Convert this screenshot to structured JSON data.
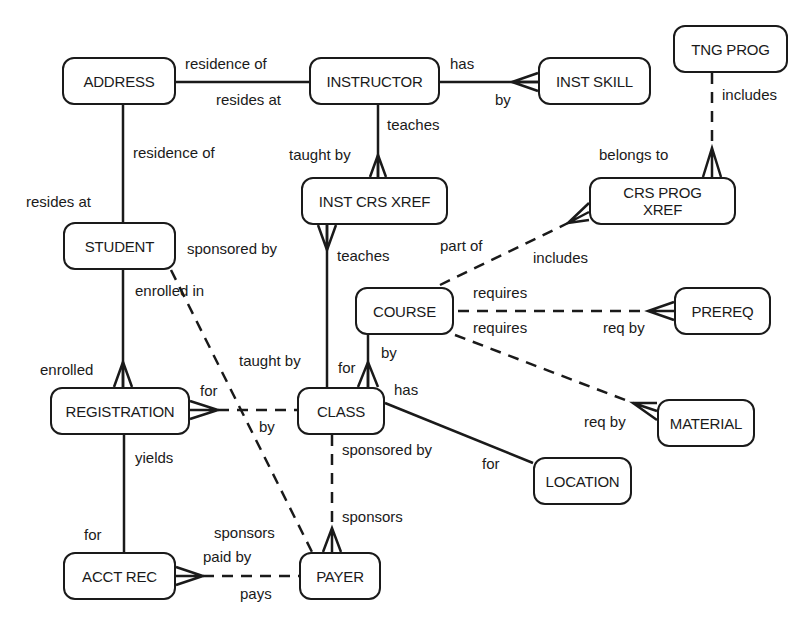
{
  "diagram": {
    "type": "entity-relationship",
    "notation": "crow's foot; solid line = identifying/mandatory, dashed line = optional",
    "entities": [
      {
        "id": "address",
        "label": "ADDRESS"
      },
      {
        "id": "instructor",
        "label": "INSTRUCTOR"
      },
      {
        "id": "inst_skill",
        "label": "INST SKILL"
      },
      {
        "id": "tng_prog",
        "label": "TNG PROG"
      },
      {
        "id": "inst_crs_xref",
        "label": "INST CRS XREF"
      },
      {
        "id": "crs_prog_xref",
        "label": "CRS PROG XREF"
      },
      {
        "id": "student",
        "label": "STUDENT"
      },
      {
        "id": "course",
        "label": "COURSE"
      },
      {
        "id": "prereq",
        "label": "PREREQ"
      },
      {
        "id": "registration",
        "label": "REGISTRATION"
      },
      {
        "id": "class",
        "label": "CLASS"
      },
      {
        "id": "material",
        "label": "MATERIAL"
      },
      {
        "id": "location",
        "label": "LOCATION"
      },
      {
        "id": "acct_rec",
        "label": "ACCT REC"
      },
      {
        "id": "payer",
        "label": "PAYER"
      }
    ],
    "relationships": [
      {
        "from": "ADDRESS",
        "to": "INSTRUCTOR",
        "style": "solid",
        "from_many": false,
        "to_many": false,
        "label_from": "residence of",
        "label_to": "resides at"
      },
      {
        "from": "INSTRUCTOR",
        "to": "INST SKILL",
        "style": "solid",
        "from_many": false,
        "to_many": true,
        "label_from": "has",
        "label_to": "by"
      },
      {
        "from": "INSTRUCTOR",
        "to": "INST CRS XREF",
        "style": "solid",
        "from_many": false,
        "to_many": true,
        "label_from": "teaches",
        "label_to": "taught by"
      },
      {
        "from": "TNG PROG",
        "to": "CRS PROG XREF",
        "style": "dashed",
        "from_many": false,
        "to_many": true,
        "label_from": "includes",
        "label_to": "belongs to"
      },
      {
        "from": "ADDRESS",
        "to": "STUDENT",
        "style": "solid",
        "from_many": false,
        "to_many": false,
        "label_from": "residence of",
        "label_to": "resides at"
      },
      {
        "from": "CLASS",
        "to": "INST CRS XREF",
        "style": "solid",
        "from_many": false,
        "to_many": true,
        "label_from": "taught by",
        "label_to": "teaches"
      },
      {
        "from": "COURSE",
        "to": "CRS PROG XREF",
        "style": "dashed",
        "from_many": false,
        "to_many": true,
        "label_from": "part of",
        "label_to": "includes"
      },
      {
        "from": "COURSE",
        "to": "PREREQ",
        "style": "dashed",
        "from_many": false,
        "to_many": true,
        "label_from": "requires",
        "label_to": "req by"
      },
      {
        "from": "COURSE",
        "to": "MATERIAL",
        "style": "dashed",
        "from_many": false,
        "to_many": true,
        "label_from": "requires",
        "label_to": "req by"
      },
      {
        "from": "COURSE",
        "to": "CLASS",
        "style": "solid",
        "from_many": false,
        "to_many": true,
        "label_from": "by",
        "label_to": "for"
      },
      {
        "from": "STUDENT",
        "to": "REGISTRATION",
        "style": "solid",
        "from_many": false,
        "to_many": true,
        "label_from": "enrolled in",
        "label_to": "enrolled"
      },
      {
        "from": "STUDENT",
        "to": "PAYER",
        "style": "dashed",
        "from_many": false,
        "to_many": false,
        "label_from": "sponsored by",
        "label_to": "sponsors"
      },
      {
        "from": "CLASS",
        "to": "REGISTRATION",
        "style": "dashed",
        "from_many": false,
        "to_many": true,
        "label_from": "by",
        "label_to": "for"
      },
      {
        "from": "CLASS",
        "to": "LOCATION",
        "style": "solid",
        "from_many": false,
        "to_many": false,
        "label_from": "has",
        "label_to": "for"
      },
      {
        "from": "PAYER",
        "to": "CLASS",
        "style": "dashed",
        "from_many": true,
        "to_many": false,
        "label_from": "sponsors",
        "label_to": "sponsored by"
      },
      {
        "from": "REGISTRATION",
        "to": "ACCT REC",
        "style": "solid",
        "from_many": false,
        "to_many": false,
        "label_from": "yields",
        "label_to": "for"
      },
      {
        "from": "PAYER",
        "to": "ACCT REC",
        "style": "dashed",
        "from_many": false,
        "to_many": true,
        "label_from": "pays",
        "label_to": "paid by"
      }
    ],
    "edge_labels": {
      "addr_instr_top": "residence of",
      "addr_instr_bottom": "resides at",
      "instr_skill_has": "has",
      "instr_skill_by": "by",
      "instr_teaches": "teaches",
      "xref_taught_by": "taught by",
      "tng_includes": "includes",
      "crs_prog_belongs": "belongs to",
      "addr_student_residence": "residence of",
      "addr_student_resides": "resides at",
      "student_sponsored_by": "sponsored by",
      "xref_class_teaches": "teaches",
      "course_part_of": "part of",
      "course_includes": "includes",
      "student_enrolled_in": "enrolled in",
      "course_prereq_requires": "requires",
      "course_material_requires": "requires",
      "prereq_req_by": "req by",
      "class_taught_by": "taught by",
      "course_class_by": "by",
      "class_course_for": "for",
      "reg_enrolled": "enrolled",
      "class_has": "has",
      "reg_for": "for",
      "class_reg_by": "by",
      "material_req_by": "req by",
      "class_sponsored_by": "sponsored by",
      "location_for": "for",
      "reg_yields": "yields",
      "payer_sponsors_class": "sponsors",
      "payer_sponsors_student": "sponsors",
      "acct_for": "for",
      "acct_paid_by": "paid by",
      "payer_pays": "pays"
    }
  }
}
